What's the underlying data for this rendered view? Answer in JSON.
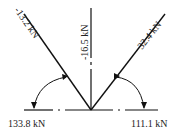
{
  "diagram": {
    "type": "force-joint",
    "members": [
      {
        "id": "left-diagonal",
        "label": "-13.2 kN"
      },
      {
        "id": "vertical",
        "label": "-16.5 kN"
      },
      {
        "id": "right-diagonal",
        "label": "32.4 kN"
      },
      {
        "id": "left-horizontal",
        "label": "133.8 kN"
      },
      {
        "id": "right-horizontal",
        "label": "111.1 kN"
      }
    ],
    "colors": {
      "line": "#111111",
      "text": "#222222"
    }
  }
}
